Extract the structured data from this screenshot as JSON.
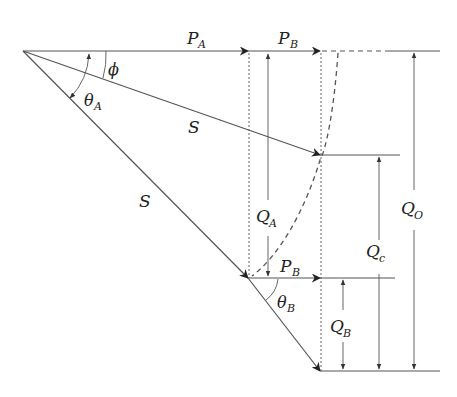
{
  "diagram": {
    "type": "phasor-geometry",
    "colors": {
      "line": "#555555",
      "text": "#222222",
      "background": "#ffffff"
    },
    "labels": {
      "PA": {
        "main": "P",
        "sub": "A"
      },
      "PB_top": {
        "main": "P",
        "sub": "B"
      },
      "PB_bottom": {
        "main": "P",
        "sub": "B"
      },
      "phi": {
        "main": "ϕ",
        "sub": ""
      },
      "thetaA": {
        "main": "θ",
        "sub": "A"
      },
      "thetaB": {
        "main": "θ",
        "sub": "B"
      },
      "S_upper": {
        "main": "S",
        "sub": ""
      },
      "S_lower": {
        "main": "S",
        "sub": ""
      },
      "QA": {
        "main": "Q",
        "sub": "A"
      },
      "QB": {
        "main": "Q",
        "sub": "B"
      },
      "Qc": {
        "main": "Q",
        "sub": "c"
      },
      "QO": {
        "main": "Q",
        "sub": "O"
      }
    },
    "caption": ""
  }
}
